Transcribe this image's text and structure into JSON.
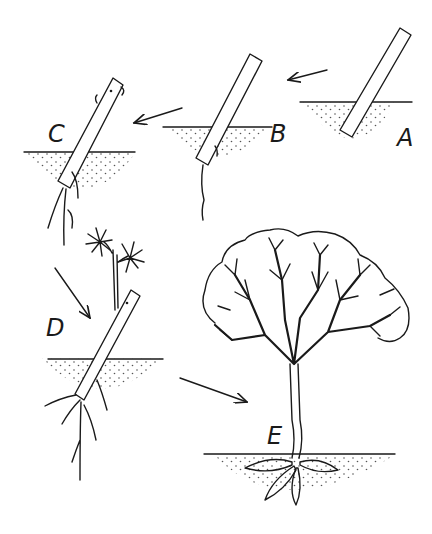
{
  "diagram": {
    "title": "",
    "stages": [
      {
        "id": "A",
        "label": "A",
        "description": "Cutting inserted in soil"
      },
      {
        "id": "B",
        "label": "B",
        "description": "Single root emerging"
      },
      {
        "id": "C",
        "label": "C",
        "description": "Roots develop, buds swelling"
      },
      {
        "id": "D",
        "label": "D",
        "description": "Shoot with leaves, root system developing"
      },
      {
        "id": "E",
        "label": "E",
        "description": "Established tree with branching crown"
      }
    ],
    "arrows": [
      {
        "from": "A",
        "to": "B"
      },
      {
        "from": "B",
        "to": "C"
      },
      {
        "from": "C",
        "to": "D"
      },
      {
        "from": "D",
        "to": "E"
      }
    ],
    "colors": {
      "ink": "#1a1a1a",
      "background": "#ffffff",
      "soil_dots": "#555555"
    }
  }
}
